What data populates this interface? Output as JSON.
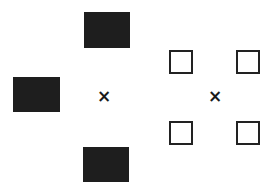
{
  "diagram": {
    "left_figure": {
      "center_marker": "×",
      "filled_squares": [
        {
          "position": "top",
          "x": 84,
          "y": 12,
          "w": 46,
          "h": 36
        },
        {
          "position": "left",
          "x": 13,
          "y": 77,
          "w": 47,
          "h": 35
        },
        {
          "position": "bottom",
          "x": 83,
          "y": 147,
          "w": 46,
          "h": 35
        }
      ],
      "fill_color": "#1e1e1e"
    },
    "right_figure": {
      "center_marker": "×",
      "outlined_squares": [
        {
          "position": "top-left",
          "x": 169,
          "y": 50,
          "size": 24
        },
        {
          "position": "top-right",
          "x": 236,
          "y": 50,
          "size": 24
        },
        {
          "position": "bottom-left",
          "x": 169,
          "y": 121,
          "size": 24
        },
        {
          "position": "bottom-right",
          "x": 236,
          "y": 121,
          "size": 24
        }
      ],
      "stroke_color": "#222222"
    }
  }
}
